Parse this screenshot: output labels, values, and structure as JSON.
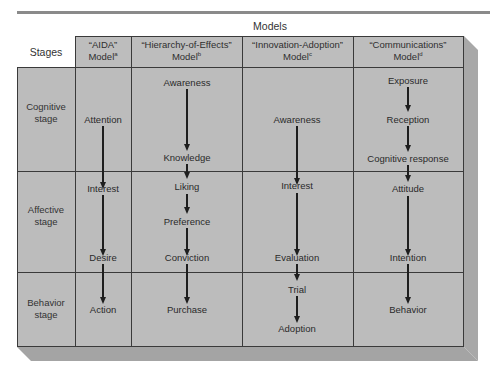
{
  "header": {
    "models_label": "Models",
    "stages_label": "Stages"
  },
  "columns": [
    {
      "title": "“AIDA”",
      "subtitle": "Model",
      "footnote": "a"
    },
    {
      "title": "“Hierarchy-of-Effects”",
      "subtitle": "Model",
      "footnote": "b"
    },
    {
      "title": "“Innovation-Adoption”",
      "subtitle": "Model",
      "footnote": "c"
    },
    {
      "title": "“Communications”",
      "subtitle": "Model",
      "footnote": "d"
    }
  ],
  "stages": [
    {
      "line1": "Cognitive",
      "line2": "stage"
    },
    {
      "line1": "Affective",
      "line2": "stage"
    },
    {
      "line1": "Behavior",
      "line2": "stage"
    }
  ],
  "models": {
    "aida": [
      "Attention",
      "Interest",
      "Desire",
      "Action"
    ],
    "hierarchy_of_effects": [
      "Awareness",
      "Knowledge",
      "Liking",
      "Preference",
      "Conviction",
      "Purchase"
    ],
    "innovation_adoption": [
      "Awareness",
      "Interest",
      "Evaluation",
      "Trial",
      "Adoption"
    ],
    "communications": [
      "Exposure",
      "Reception",
      "Cognitive response",
      "Attitude",
      "Intention",
      "Behavior"
    ]
  },
  "colors": {
    "cell_fill": "#bcbcbc",
    "grid_line": "#3a3a3a",
    "arrow": "#1e1e1e",
    "frame_side": "#a8a8a8",
    "top_rule": "#8a8a8a"
  }
}
